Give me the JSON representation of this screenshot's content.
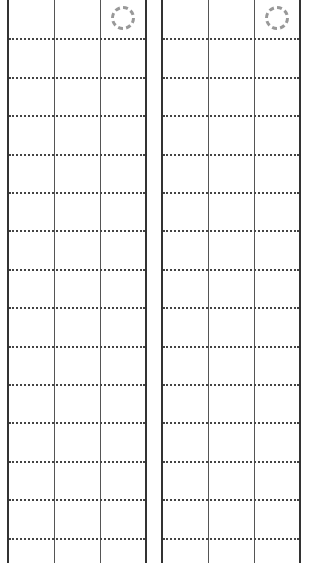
{
  "layout": {
    "panels": [
      {
        "id": "left",
        "left": 7,
        "width": 140
      },
      {
        "id": "right",
        "left": 161,
        "width": 140
      }
    ],
    "columns_per_panel": 3,
    "rows_per_panel": 15,
    "row_height": 38.4
  },
  "icons": [
    {
      "panel": "left",
      "name": "dashed-circle-icon"
    },
    {
      "panel": "right",
      "name": "dashed-circle-icon"
    }
  ],
  "colors": {
    "border": "#333333",
    "divider": "#555555",
    "dotted": "#444444",
    "icon": "#999999"
  }
}
